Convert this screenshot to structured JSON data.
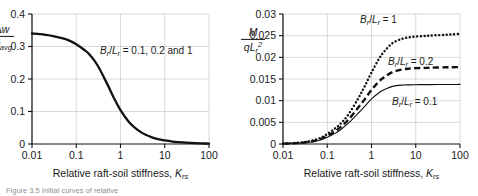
{
  "figure": {
    "caption": "Figure 3.5  Initial curves of relative",
    "panel_count": 2
  },
  "chart_data": [
    {
      "id": "panel-left",
      "type": "line",
      "title": "",
      "xlabel": "Relative raft-soil stiffness, Krs",
      "xlabel_main": "Relative raft-soil stiffness, ",
      "xlabel_sym": "K",
      "xlabel_sub": "rs",
      "ylabel": "Δw / w avg",
      "ylabel_num_sym": "Δw",
      "ylabel_den_sym": "w",
      "ylabel_den_sub": "avg",
      "xscale": "log",
      "xlim": [
        0.01,
        100
      ],
      "xticks": [
        0.01,
        0.1,
        1,
        10,
        100
      ],
      "xtick_labels": [
        "0.01",
        "0.1",
        "1",
        "10",
        "100"
      ],
      "ylim": [
        0,
        0.4
      ],
      "yticks": [
        0,
        0.1,
        0.2,
        0.3,
        0.4
      ],
      "ytick_labels": [
        "0",
        "0.1",
        "0.2",
        "0.3",
        "0.4"
      ],
      "grid": true,
      "legend": "none",
      "annotations": [
        {
          "name": "curve-label-all",
          "text": "Br/Lr = 0.1, 0.2 and 1",
          "sym1": "B",
          "sub1": "r",
          "sym2": "L",
          "sub2": "r",
          "tail": " = 0.1, 0.2 and 1",
          "x_px": 100,
          "y_px": 54
        }
      ],
      "series": [
        {
          "name": "Br/Lr = 0.1, 0.2 and 1",
          "style": "solid-thick",
          "color": "#111111",
          "width": 2.3,
          "x": [
            0.01,
            0.015,
            0.02,
            0.03,
            0.05,
            0.07,
            0.1,
            0.15,
            0.2,
            0.3,
            0.5,
            0.7,
            1,
            1.5,
            2,
            3,
            5,
            7,
            10,
            15,
            20,
            30,
            50,
            70,
            100
          ],
          "y": [
            0.34,
            0.338,
            0.336,
            0.332,
            0.325,
            0.318,
            0.307,
            0.29,
            0.275,
            0.243,
            0.185,
            0.143,
            0.104,
            0.07,
            0.053,
            0.035,
            0.021,
            0.015,
            0.011,
            0.0075,
            0.0058,
            0.004,
            0.0025,
            0.0018,
            0.0012
          ]
        }
      ]
    },
    {
      "id": "panel-right",
      "type": "line",
      "title": "",
      "xlabel": "Relative raft-soil stiffness, Krs",
      "xlabel_main": "Relative raft-soil stiffness, ",
      "xlabel_sym": "K",
      "xlabel_sub": "rs",
      "ylabel": "M / qLr^2",
      "ylabel_num_sym": "M",
      "ylabel_den_sym": "qL",
      "ylabel_den_sub": "r",
      "ylabel_den_sup": "2",
      "xscale": "log",
      "xlim": [
        0.01,
        100
      ],
      "xticks": [
        0.01,
        0.1,
        1,
        10,
        100
      ],
      "xtick_labels": [
        "0.01",
        "0.1",
        "1",
        "10",
        "100"
      ],
      "ylim": [
        0,
        0.03
      ],
      "yticks": [
        0,
        0.005,
        0.01,
        0.015,
        0.02,
        0.025,
        0.03
      ],
      "ytick_labels": [
        "0",
        "0.005",
        "0.01",
        "0.015",
        "0.02",
        "0.025",
        "0.03"
      ],
      "grid": true,
      "legend": "inline-labels",
      "annotations": [
        {
          "name": "curve-label-br-lr-1",
          "text": "Br/Lr = 1",
          "sym1": "B",
          "sub1": "r",
          "sym2": "L",
          "sub2": "r",
          "tail": " = 1",
          "x_px": 360,
          "y_px": 23
        },
        {
          "name": "curve-label-br-lr-02",
          "text": "Br/Lr = 0.2",
          "sym1": "B",
          "sub1": "r",
          "sym2": "L",
          "sub2": "r",
          "tail": " = 0.2",
          "x_px": 388,
          "y_px": 65
        },
        {
          "name": "curve-label-br-lr-01",
          "text": "Br/Lr = 0.1",
          "sym1": "B",
          "sub1": "r",
          "sym2": "L",
          "sub2": "r",
          "tail": " = 0.1",
          "x_px": 392,
          "y_px": 105
        }
      ],
      "series": [
        {
          "name": "Br/Lr = 1",
          "style": "dotted",
          "color": "#111111",
          "width": 2.4,
          "x": [
            0.01,
            0.02,
            0.03,
            0.05,
            0.07,
            0.1,
            0.15,
            0.2,
            0.3,
            0.5,
            0.7,
            1,
            1.5,
            2,
            3,
            5,
            7,
            10,
            15,
            20,
            30,
            50,
            70,
            100
          ],
          "y": [
            0.0001,
            0.00025,
            0.00045,
            0.0009,
            0.0014,
            0.0023,
            0.0036,
            0.0047,
            0.0068,
            0.0105,
            0.0133,
            0.0165,
            0.0198,
            0.0215,
            0.0233,
            0.0243,
            0.0246,
            0.0248,
            0.0249,
            0.025,
            0.0251,
            0.0252,
            0.0253,
            0.0254
          ]
        },
        {
          "name": "Br/Lr = 0.2",
          "style": "dashed",
          "color": "#111111",
          "width": 2.4,
          "x": [
            0.01,
            0.02,
            0.03,
            0.05,
            0.07,
            0.1,
            0.15,
            0.2,
            0.3,
            0.5,
            0.7,
            1,
            1.5,
            2,
            3,
            5,
            7,
            10,
            15,
            20,
            30,
            50,
            70,
            100
          ],
          "y": [
            8e-05,
            0.0002,
            0.00035,
            0.0007,
            0.0011,
            0.00185,
            0.0029,
            0.0039,
            0.0056,
            0.0084,
            0.0103,
            0.0125,
            0.0145,
            0.0155,
            0.0166,
            0.0172,
            0.0174,
            0.0175,
            0.01755,
            0.0176,
            0.01765,
            0.0177,
            0.01772,
            0.01775
          ]
        },
        {
          "name": "Br/Lr = 0.1",
          "style": "solid-thin",
          "color": "#111111",
          "width": 1.1,
          "x": [
            0.01,
            0.02,
            0.03,
            0.05,
            0.07,
            0.1,
            0.15,
            0.2,
            0.3,
            0.5,
            0.7,
            1,
            1.5,
            2,
            3,
            5,
            7,
            10,
            15,
            20,
            30,
            50,
            70,
            100
          ],
          "y": [
            6e-05,
            0.00016,
            0.00028,
            0.00058,
            0.00092,
            0.00155,
            0.00245,
            0.0033,
            0.0048,
            0.0071,
            0.0087,
            0.0104,
            0.0119,
            0.0126,
            0.0133,
            0.0136,
            0.01365,
            0.01368,
            0.0137,
            0.01371,
            0.01372,
            0.01373,
            0.01374,
            0.01375
          ]
        }
      ]
    }
  ]
}
